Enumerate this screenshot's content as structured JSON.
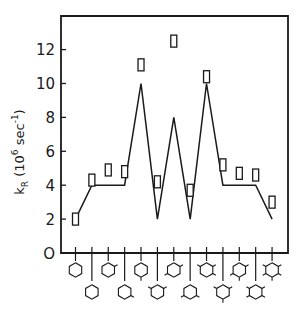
{
  "chart_data": {
    "type": "line",
    "title": "",
    "xlabel": "",
    "ylabel": "k_R (10^6 sec^-1)",
    "ylabel_parts": {
      "main": "k",
      "sub": "R",
      "paren_open": "(",
      "base": "10",
      "exp": "6",
      "unit": " sec",
      "unit_exp": "-1",
      "paren_close": ")"
    },
    "ylim": [
      0,
      14
    ],
    "yticks": [
      0,
      2,
      4,
      6,
      8,
      10,
      12
    ],
    "ytick_labels": [
      "O",
      "2",
      "4",
      "6",
      "8",
      "10",
      "12"
    ],
    "grid": false,
    "legend": null,
    "categories": [
      "benzene",
      "toluene",
      "o-xylene",
      "m-xylene",
      "p-xylene",
      "1,2,3-trimethylbenzene",
      "1,2,4-trimethylbenzene",
      "1,3,5-trimethylbenzene",
      "1,2,3,4-tetramethylbenzene",
      "1,2,3,5-tetramethylbenzene",
      "1,2,4,5-tetramethylbenzene",
      "pentamethylbenzene",
      "hexamethylbenzene"
    ],
    "series": [
      {
        "name": "calculated (line)",
        "style": "line",
        "values": [
          2,
          4,
          4,
          4,
          10,
          2,
          8,
          2,
          10,
          4,
          4,
          4,
          2
        ]
      },
      {
        "name": "experimental (open rectangles)",
        "style": "marker",
        "values": [
          2.0,
          4.3,
          4.9,
          4.8,
          11.1,
          4.2,
          12.5,
          3.7,
          10.4,
          5.2,
          4.7,
          4.6,
          3.0
        ]
      }
    ],
    "x_axis_icons": {
      "description": "hexagon (benzene ring) structures with methyl substituent stubs, alternating upper/lower rows",
      "rows": [
        "upper",
        "lower",
        "upper",
        "lower",
        "upper",
        "lower",
        "upper",
        "lower",
        "upper",
        "lower",
        "upper",
        "lower",
        "upper"
      ],
      "substituents": [
        [],
        [
          0
        ],
        [
          0,
          1
        ],
        [
          0,
          2
        ],
        [
          0,
          3
        ],
        [
          0,
          1,
          5
        ],
        [
          0,
          1,
          4
        ],
        [
          0,
          2,
          4
        ],
        [
          0,
          1,
          2,
          5
        ],
        [
          0,
          1,
          3,
          5
        ],
        [
          0,
          1,
          3,
          4
        ],
        [
          0,
          1,
          2,
          4,
          5
        ],
        [
          0,
          1,
          2,
          3,
          4,
          5
        ]
      ]
    }
  }
}
